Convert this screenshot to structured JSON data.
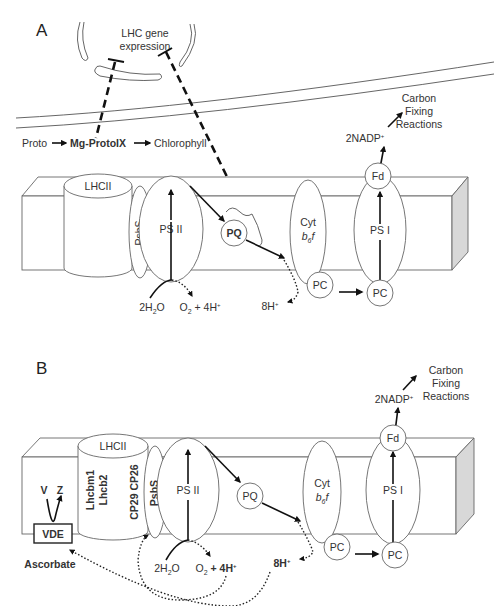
{
  "panelA": {
    "label": "A",
    "lhc_gene_expression": [
      "LHC gene",
      "expression"
    ],
    "pathway": {
      "proto": "Proto",
      "mg_protoix": "Mg-ProtoIX",
      "chlorophyll": "Chlorophyll"
    },
    "carbon": [
      "Carbon",
      "Fixing",
      "Reactions"
    ],
    "nadp": "2NADP",
    "nadp_sup": "+",
    "lhcii": "LHCII",
    "psbs": "PsbS",
    "psii": "PS II",
    "pq": "PQ",
    "cyt": "Cyt",
    "b6f": "b",
    "b6f_sub": "6",
    "b6f_f": "f",
    "psi": "PS I",
    "fd": "Fd",
    "pc1": "PC",
    "pc2": "PC",
    "water": "2H",
    "water_sub": "2",
    "water_o": "O",
    "oxygen": "O",
    "oxygen_sub": "2",
    "plus4h": " + 4H",
    "h_sup": "+",
    "h8": "8H",
    "h8_sup": "+"
  },
  "panelB": {
    "label": "B",
    "carbon": [
      "Carbon",
      "Fixing",
      "Reactions"
    ],
    "nadp": "2NADP",
    "nadp_sup": "+",
    "lhcii": "LHCII",
    "lhcbm1": "Lhcbm1",
    "lhcb2": "Lhcb2",
    "cp29_cp26": "CP29 CP26",
    "psbs": "PsbS",
    "psii": "PS II",
    "pq": "PQ",
    "cyt": "Cyt",
    "b6f": "b",
    "b6f_sub": "6",
    "b6f_f": "f",
    "psi": "PS I",
    "fd": "Fd",
    "pc1": "PC",
    "pc2": "PC",
    "v": "V",
    "z": "Z",
    "vde": "VDE",
    "ascorbate": "Ascorbate",
    "water": "2H",
    "water_sub": "2",
    "water_o": "O",
    "oxygen": "O",
    "oxygen_sub": "2",
    "plus4h": " + 4H",
    "h_sup": "+",
    "h8": "8H",
    "h8_sup": "+"
  }
}
